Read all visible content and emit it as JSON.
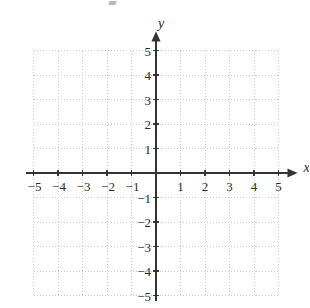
{
  "figure": {
    "kind": "cartesian-coordinate-plane",
    "background_color": "#ffffff",
    "axis_color": "#333333",
    "grid_color": "#c9c9c9",
    "label_color": "#2b2b2b"
  },
  "axes": {
    "x_name": "x",
    "y_name": "y",
    "x_name_position": "right-of-positive-x-arrow",
    "y_name_position": "above-positive-y-arrow",
    "arrowheads": [
      "positive-x",
      "positive-y"
    ]
  },
  "chart_data": {
    "type": "scatter",
    "title": "",
    "subtitle": "",
    "xlabel": "x",
    "ylabel": "y",
    "xlim": [
      -5,
      5
    ],
    "ylim": [
      -5,
      5
    ],
    "grid": true,
    "grid_style": "dotted",
    "grid_step": 1,
    "legend": null,
    "annotations": [],
    "series": [],
    "x_tick_values": [
      -5,
      -4,
      -3,
      -2,
      -1,
      1,
      2,
      3,
      4,
      5
    ],
    "y_tick_values": [
      5,
      4,
      3,
      2,
      1,
      -1,
      -2,
      -3,
      -4,
      -5
    ],
    "x_tick_labels": [
      "−5",
      "−4",
      "−3",
      "−2",
      "−1",
      "1",
      "2",
      "3",
      "4",
      "5"
    ],
    "y_tick_labels": [
      "5",
      "4",
      "3",
      "2",
      "1",
      "−1",
      "−2",
      "−3",
      "−4",
      "−5"
    ],
    "origin_label": ""
  },
  "geometry": {
    "origin_px": [
      156,
      173
    ],
    "unit_px": 24.5,
    "grid_left_px": 33.5,
    "grid_right_px": 278.5,
    "grid_top_px": 50.5,
    "grid_bottom_px": 295.5
  }
}
